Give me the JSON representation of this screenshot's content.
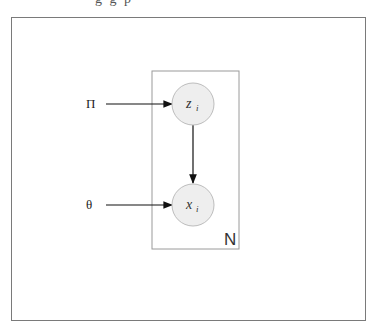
{
  "header": {
    "cropped_text": "g g p"
  },
  "diagram": {
    "plate": {
      "label": "N"
    },
    "nodes": [
      {
        "id": "z",
        "label": "z",
        "subscript": "i"
      },
      {
        "id": "x",
        "label": "x",
        "subscript": "i"
      }
    ],
    "inputs": [
      {
        "id": "pi",
        "label": "Π",
        "target": "z"
      },
      {
        "id": "theta",
        "label": "θ",
        "target": "x"
      }
    ],
    "edges": [
      {
        "from": "pi",
        "to": "z"
      },
      {
        "from": "z",
        "to": "x"
      },
      {
        "from": "theta",
        "to": "x"
      }
    ],
    "colors": {
      "node_fill": "#eeeeee",
      "node_stroke": "#bdbdbd",
      "edge": "#111111",
      "plate_stroke": "#9a9a9a"
    }
  }
}
